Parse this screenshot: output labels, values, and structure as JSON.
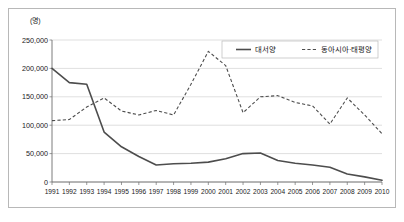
{
  "chart_data": {
    "type": "line",
    "title": "",
    "xlabel": "",
    "ylabel": "",
    "unit_label": "(명)",
    "grid": true,
    "legend_position": "top-right",
    "ylim": [
      0,
      250000
    ],
    "yticks": [
      0,
      50000,
      100000,
      150000,
      200000,
      250000
    ],
    "ytick_labels": [
      "0",
      "50,000",
      "100,000",
      "150,000",
      "200,000",
      "250,000"
    ],
    "categories": [
      "1991",
      "1992",
      "1993",
      "1994",
      "1995",
      "1996",
      "1997",
      "1998",
      "1999",
      "2000",
      "2001",
      "2002",
      "2003",
      "2004",
      "2005",
      "2006",
      "2007",
      "2008",
      "2009",
      "2010"
    ],
    "series": [
      {
        "name": "대서양",
        "style": "solid",
        "color": "#4d4d4d",
        "values": [
          200000,
          175000,
          172000,
          88000,
          62000,
          45000,
          30000,
          32000,
          33000,
          35000,
          41000,
          50000,
          51000,
          38000,
          33000,
          30000,
          26000,
          14000,
          9000,
          3000
        ]
      },
      {
        "name": "동아시아·태평양",
        "style": "dashed",
        "color": "#4d4d4d",
        "values": [
          108000,
          110000,
          132000,
          148000,
          125000,
          118000,
          126000,
          118000,
          172000,
          230000,
          205000,
          122000,
          150000,
          152000,
          140000,
          134000,
          102000,
          148000,
          118000,
          85000
        ]
      }
    ]
  },
  "legend": {
    "items": [
      {
        "label": "대서양",
        "style": "solid"
      },
      {
        "label": "동아시아·태평양",
        "style": "dashed"
      }
    ]
  }
}
